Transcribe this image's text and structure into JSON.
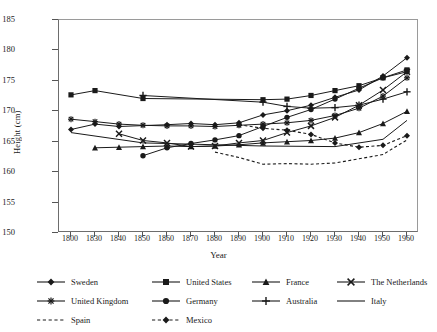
{
  "chart_data": {
    "type": "line",
    "title": "",
    "xlabel": "Year",
    "ylabel": "Height (cm)",
    "ylim": [
      150,
      185
    ],
    "ytick_step": 5,
    "yticks": [
      150,
      155,
      160,
      165,
      170,
      175,
      180,
      185
    ],
    "grid": false,
    "legend_position": "bottom",
    "categories": [
      1800,
      1830,
      1840,
      1850,
      1860,
      1870,
      1880,
      1890,
      1900,
      1910,
      1920,
      1930,
      1940,
      1950,
      1960
    ],
    "series": [
      {
        "name": "Sweden",
        "marker": "diamond",
        "line": "solid",
        "x": [
          1800,
          1830,
          1840,
          1850,
          1860,
          1870,
          1880,
          1890,
          1900,
          1910,
          1920,
          1930,
          1940,
          1950,
          1960
        ],
        "values": [
          167.0,
          167.9,
          167.5,
          null,
          167.8,
          168.0,
          167.8,
          168.1,
          169.4,
          170.1,
          171.0,
          172.3,
          173.5,
          175.8,
          178.8
        ]
      },
      {
        "name": "United States",
        "marker": "square",
        "line": "solid",
        "x": [
          1800,
          1830,
          1850,
          1880,
          1890,
          1900,
          1910,
          1920,
          1930,
          1940,
          1950,
          1960
        ],
        "values": [
          172.7,
          173.4,
          172.1,
          null,
          null,
          171.9,
          172.0,
          172.6,
          173.4,
          174.2,
          175.5,
          176.8
        ]
      },
      {
        "name": "France",
        "marker": "triangle",
        "line": "solid",
        "x": [
          1830,
          1840,
          1850,
          1860,
          1870,
          1880,
          1890,
          1900,
          1910,
          1920,
          1930,
          1940,
          1950,
          1960
        ],
        "values": [
          164.0,
          164.1,
          164.2,
          164.3,
          164.2,
          164.3,
          164.5,
          164.8,
          165.0,
          165.2,
          165.6,
          166.5,
          168.0,
          170.0
        ]
      },
      {
        "name": "The Netherlands",
        "marker": "cross",
        "line": "solid",
        "x": [
          1840,
          1850,
          1860,
          1870,
          1880,
          1890,
          1900,
          1910,
          1920,
          1930,
          1940,
          1950,
          1960
        ],
        "values": [
          166.3,
          165.2,
          164.8,
          164.2,
          164.3,
          164.8,
          165.2,
          166.5,
          167.6,
          169.0,
          171.0,
          173.5,
          176.5
        ]
      },
      {
        "name": "United Kingdom",
        "marker": "asterisk",
        "line": "solid",
        "x": [
          1800,
          1830,
          1840,
          1850,
          1860,
          1870,
          1880,
          1890,
          1900,
          1910,
          1920,
          1930,
          1940,
          1950,
          1960
        ],
        "values": [
          168.7,
          168.3,
          167.9,
          167.7,
          167.6,
          167.6,
          167.5,
          167.7,
          167.9,
          168.1,
          168.5,
          169.3,
          170.5,
          172.5,
          175.5
        ]
      },
      {
        "name": "Germany",
        "marker": "circle",
        "line": "solid",
        "x": [
          1850,
          1860,
          1870,
          1880,
          1890,
          1900,
          1910,
          1920,
          1930,
          1940,
          1950,
          1960
        ],
        "values": [
          162.7,
          164.0,
          164.7,
          165.3,
          166.0,
          167.5,
          169.0,
          170.3,
          172.0,
          173.8,
          175.5,
          176.5
        ]
      },
      {
        "name": "Australia",
        "marker": "plus",
        "line": "solid",
        "x": [
          1850,
          1890,
          1900,
          1910,
          1920,
          1930,
          1940,
          1950,
          1960
        ],
        "values": [
          172.6,
          null,
          171.5,
          170.8,
          170.5,
          170.6,
          171.0,
          172.0,
          173.2
        ]
      },
      {
        "name": "Italy",
        "marker": "none",
        "line": "solid",
        "x": [
          1800,
          1850,
          1900,
          1930,
          1950,
          1960
        ],
        "values": [
          166.5,
          164.8,
          164.3,
          164.2,
          165.4,
          168.5
        ]
      },
      {
        "name": "Spain",
        "marker": "none",
        "line": "dashed",
        "x": [
          1880,
          1890,
          1900,
          1910,
          1920,
          1930,
          1940,
          1950,
          1960
        ],
        "values": [
          163.3,
          162.4,
          161.3,
          161.4,
          161.3,
          161.5,
          162.2,
          162.9,
          165.3
        ]
      },
      {
        "name": "Mexico",
        "marker": "diamond",
        "line": "dashed",
        "x": [
          1890,
          1900,
          1910,
          1920,
          1930,
          1940,
          1950,
          1960
        ],
        "values": [
          167.8,
          167.2,
          166.9,
          166.2,
          164.8,
          164.1,
          164.4,
          166.0
        ]
      }
    ]
  },
  "axes": {
    "x_title": "Year",
    "y_title": "Height (cm)",
    "y_tick_labels": [
      "185",
      "180",
      "175",
      "170",
      "165",
      "160",
      "155",
      "150"
    ],
    "x_tick_labels": [
      "1800",
      "1830",
      "1840",
      "1850",
      "1860",
      "1870",
      "1880",
      "1890",
      "1900",
      "1910",
      "1920",
      "1930",
      "1940",
      "1950",
      "1960"
    ]
  },
  "legend": {
    "rows": [
      [
        {
          "label": "Sweden",
          "marker": "diamond",
          "line": "solid"
        },
        {
          "label": "United States",
          "marker": "square",
          "line": "solid"
        },
        {
          "label": "France",
          "marker": "triangle",
          "line": "solid"
        },
        {
          "label": "The Netherlands",
          "marker": "cross",
          "line": "solid"
        }
      ],
      [
        {
          "label": "United Kingdom",
          "marker": "asterisk",
          "line": "solid"
        },
        {
          "label": "Germany",
          "marker": "circle",
          "line": "solid"
        },
        {
          "label": "Australia",
          "marker": "plus",
          "line": "solid"
        },
        {
          "label": "Italy",
          "marker": "none",
          "line": "solid"
        }
      ],
      [
        {
          "label": "Spain",
          "marker": "none",
          "line": "dashed"
        },
        {
          "label": "Mexico",
          "marker": "diamond",
          "line": "dashed"
        }
      ]
    ]
  },
  "colors": {
    "ink": "#1a1a1a",
    "frame": "#6d6d6d",
    "background": "#ffffff"
  }
}
